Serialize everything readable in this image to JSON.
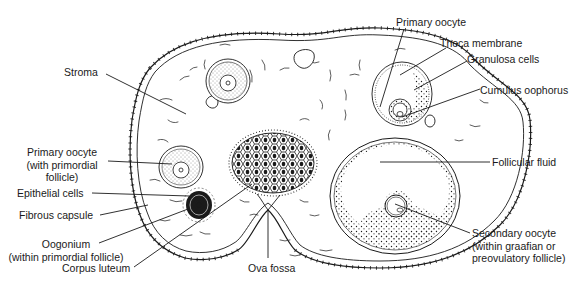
{
  "figure": {
    "colors": {
      "ink": "#1a1a1a",
      "background": "#ffffff"
    }
  },
  "labels": {
    "stroma": "Stroma",
    "primary_oocyte_left": [
      "Primary oocyte",
      "(with primordial",
      "follicle)"
    ],
    "epithelial_cells": "Epithelial cells",
    "fibrous_capsule": "Fibrous capsule",
    "oogonium": [
      "Oogonium",
      "(within primordial follicle)"
    ],
    "corpus_luteum": "Corpus luteum",
    "ova_fossa": "Ova fossa",
    "primary_oocyte_right": "Primary oocyte",
    "theca_membrane": "Theca membrane",
    "granulosa_cells": "Granulosa cells",
    "cumulus_oophorus": "Cumulus oophorus",
    "follicular_fluid": "Follicular fluid",
    "secondary_oocyte": [
      "Secondary oocyte",
      "(within graafian or",
      "preovulatory follicle)"
    ]
  }
}
